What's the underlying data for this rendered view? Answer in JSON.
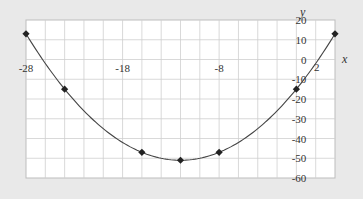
{
  "chart_data": {
    "type": "line",
    "title": "",
    "xlabel": "x",
    "ylabel": "y",
    "xlim": [
      -28,
      4
    ],
    "ylim": [
      -60,
      20
    ],
    "grid": true,
    "x_grid_step": 2,
    "y_grid_step": 10,
    "x_tick_labels": [
      {
        "value": -28,
        "label": "-28"
      },
      {
        "value": -18,
        "label": "-18"
      },
      {
        "value": -8,
        "label": "-8"
      },
      {
        "value": 2,
        "label": "2"
      }
    ],
    "y_tick_labels": [
      {
        "value": 20,
        "label": "20"
      },
      {
        "value": 10,
        "label": "10"
      },
      {
        "value": 0,
        "label": "0"
      },
      {
        "value": -10,
        "label": "-10"
      },
      {
        "value": -20,
        "label": "-20"
      },
      {
        "value": -30,
        "label": "-30"
      },
      {
        "value": -40,
        "label": "-40"
      },
      {
        "value": -50,
        "label": "-50"
      },
      {
        "value": -60,
        "label": "-60"
      }
    ],
    "series": [
      {
        "name": "y = 0.25(x+12)^2 - 51",
        "marker": "diamond",
        "smooth": true,
        "x": [
          -28,
          -24,
          -16,
          -12,
          -8,
          0,
          4
        ],
        "y": [
          13,
          -15,
          -47,
          -51,
          -47,
          -15,
          13
        ]
      }
    ],
    "colors": {
      "background": "#e9e9e9",
      "plot_background": "#ffffff",
      "grid": "#cfcfcf",
      "line": "#444444",
      "marker": "#222222"
    }
  }
}
